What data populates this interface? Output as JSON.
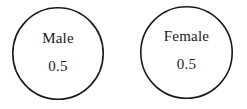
{
  "diagram": {
    "type": "node-diagram",
    "background_color": "#ffffff",
    "stroke_color": "#1a1a1a",
    "text_color": "#1a1a1a",
    "nodes": [
      {
        "id": "male",
        "shape": "circle",
        "label": "Male",
        "value": "0.5"
      },
      {
        "id": "female",
        "shape": "circle",
        "label": "Female",
        "value": "0.5"
      }
    ]
  }
}
